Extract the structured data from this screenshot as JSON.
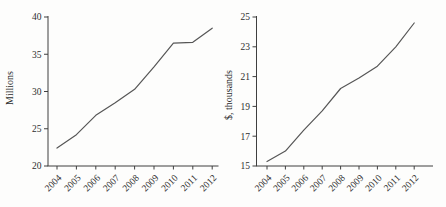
{
  "figure": {
    "background": "#fdfdfc",
    "title": "",
    "chart_count": 2
  },
  "chart_data": [
    {
      "type": "line",
      "title": "",
      "xlabel": "",
      "ylabel": "Millions",
      "categories": [
        "2004",
        "2005",
        "2006",
        "2007",
        "2008",
        "2009",
        "2010",
        "2011",
        "2012"
      ],
      "values": [
        22.4,
        24.2,
        26.8,
        28.5,
        30.3,
        33.3,
        36.5,
        36.6,
        38.5
      ],
      "ylim": [
        20,
        40
      ],
      "yticks": [
        20,
        25,
        30,
        35,
        40
      ],
      "grid": false,
      "legend": "none",
      "x_tick_rotation": -45,
      "line_color": "#565656",
      "axis_color": "#3f3f3f",
      "text_color": "#2e2e2e"
    },
    {
      "type": "line",
      "title": "",
      "xlabel": "",
      "ylabel": "$, thousands",
      "categories": [
        "2004",
        "2005",
        "2006",
        "2007",
        "2008",
        "2009",
        "2010",
        "2011",
        "2012"
      ],
      "values": [
        15.3,
        16.0,
        17.4,
        18.7,
        20.2,
        20.9,
        21.7,
        23.0,
        24.6
      ],
      "ylim": [
        15,
        25
      ],
      "yticks": [
        15,
        17,
        19,
        21,
        23,
        25
      ],
      "grid": false,
      "legend": "none",
      "x_tick_rotation": -45,
      "line_color": "#565656",
      "axis_color": "#3f3f3f",
      "text_color": "#2e2e2e"
    }
  ]
}
